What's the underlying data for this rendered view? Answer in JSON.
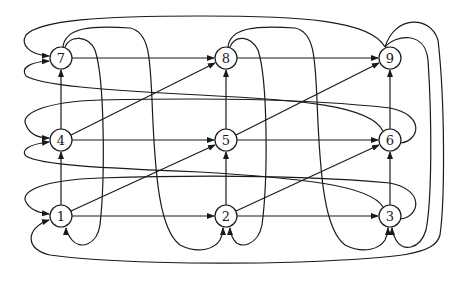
{
  "diagram": {
    "type": "directed-graph",
    "nodes": [
      {
        "id": "1",
        "label": "1",
        "x": 61,
        "y": 216
      },
      {
        "id": "2",
        "label": "2",
        "x": 226,
        "y": 216
      },
      {
        "id": "3",
        "label": "3",
        "x": 390,
        "y": 216
      },
      {
        "id": "4",
        "label": "4",
        "x": 61,
        "y": 140
      },
      {
        "id": "5",
        "label": "5",
        "x": 226,
        "y": 140
      },
      {
        "id": "6",
        "label": "6",
        "x": 390,
        "y": 140
      },
      {
        "id": "7",
        "label": "7",
        "x": 61,
        "y": 58
      },
      {
        "id": "8",
        "label": "8",
        "x": 226,
        "y": 58
      },
      {
        "id": "9",
        "label": "9",
        "x": 390,
        "y": 58
      }
    ],
    "edges": [
      {
        "from": "1",
        "to": "2"
      },
      {
        "from": "2",
        "to": "3"
      },
      {
        "from": "4",
        "to": "5"
      },
      {
        "from": "5",
        "to": "6"
      },
      {
        "from": "7",
        "to": "8"
      },
      {
        "from": "8",
        "to": "9"
      },
      {
        "from": "1",
        "to": "4"
      },
      {
        "from": "4",
        "to": "7"
      },
      {
        "from": "2",
        "to": "5"
      },
      {
        "from": "5",
        "to": "8"
      },
      {
        "from": "3",
        "to": "6"
      },
      {
        "from": "6",
        "to": "9"
      },
      {
        "from": "1",
        "to": "5"
      },
      {
        "from": "4",
        "to": "8"
      },
      {
        "from": "2",
        "to": "6"
      },
      {
        "from": "5",
        "to": "9"
      },
      {
        "from": "9",
        "to": "7",
        "wrap": true
      },
      {
        "from": "6",
        "to": "7",
        "wrap": true
      },
      {
        "from": "6",
        "to": "4",
        "wrap": true
      },
      {
        "from": "3",
        "to": "4",
        "wrap": true
      },
      {
        "from": "3",
        "to": "1",
        "wrap": true
      },
      {
        "from": "9",
        "to": "1",
        "wrap": true
      },
      {
        "from": "7",
        "to": "1",
        "wrap": true
      },
      {
        "from": "7",
        "to": "2",
        "wrap": true
      },
      {
        "from": "8",
        "to": "2",
        "wrap": true
      },
      {
        "from": "8",
        "to": "3",
        "wrap": true
      },
      {
        "from": "9",
        "to": "3",
        "wrap": true
      }
    ],
    "colors": {
      "stroke": "#1a1a1a",
      "background": "#ffffff",
      "node_fill": "#ffffff"
    }
  }
}
